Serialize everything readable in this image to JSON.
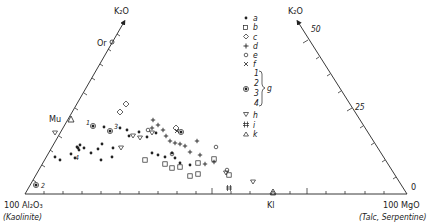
{
  "chart_data": {
    "type": "scatter",
    "subtype": "ternary-projection",
    "title": "",
    "vertices": {
      "left": {
        "label": "100 Al₂O₃",
        "sublabel": "(Kaolinite)"
      },
      "right": {
        "label": "100 MgO",
        "sublabel": "(Talc, Serpentine)"
      },
      "top_left_axis": {
        "label": "K₂O"
      },
      "top_right_axis": {
        "label": "K₂O"
      }
    },
    "left_axis_markers": [
      {
        "label": "Or",
        "meaning": "orthoclase"
      },
      {
        "label": "Mu",
        "meaning": "muscovite"
      }
    ],
    "bottom_axis_markers": [
      {
        "label": "Kl"
      }
    ],
    "right_axis_ticks": [
      "50",
      "25",
      "0"
    ],
    "legend": [
      {
        "symbol": "filled-dot",
        "label": "a"
      },
      {
        "symbol": "open-square",
        "label": "b"
      },
      {
        "symbol": "open-diamond",
        "label": "c"
      },
      {
        "symbol": "plus",
        "label": "d"
      },
      {
        "symbol": "open-circle",
        "label": "e"
      },
      {
        "symbol": "cross",
        "label": "f"
      },
      {
        "symbol": "circled-dot",
        "label": "g",
        "members": [
          "1",
          "2",
          "3",
          "4"
        ]
      },
      {
        "symbol": "open-down-triangle",
        "label": "h"
      },
      {
        "symbol": "hash",
        "label": "i"
      },
      {
        "symbol": "open-up-triangle",
        "label": "k"
      }
    ],
    "series": [
      {
        "name": "a",
        "symbol": "filled-dot",
        "points_px": [
          [
            55,
            157
          ],
          [
            60,
            160
          ],
          [
            71,
            154
          ],
          [
            77,
            147
          ],
          [
            78,
            148
          ],
          [
            79,
            150
          ],
          [
            80,
            145
          ],
          [
            75,
            158
          ],
          [
            84,
            148
          ],
          [
            91,
            153
          ],
          [
            98,
            149
          ],
          [
            102,
            144
          ],
          [
            101,
            160
          ],
          [
            104,
            127
          ],
          [
            113,
            148
          ],
          [
            112,
            157
          ],
          [
            127,
            130
          ],
          [
            129,
            136
          ],
          [
            120,
            128
          ],
          [
            139,
            132
          ],
          [
            147,
            137
          ],
          [
            152,
            153
          ],
          [
            158,
            155
          ],
          [
            165,
            157
          ],
          [
            172,
            153
          ],
          [
            175,
            158
          ],
          [
            180,
            163
          ],
          [
            190,
            165
          ],
          [
            156,
            133
          ]
        ]
      },
      {
        "name": "b",
        "symbol": "open-square",
        "points_px": [
          [
            145,
            160
          ],
          [
            165,
            164
          ],
          [
            172,
            168
          ],
          [
            180,
            167
          ],
          [
            190,
            176
          ],
          [
            198,
            163
          ],
          [
            198,
            174
          ],
          [
            214,
            159
          ],
          [
            229,
            175
          ]
        ]
      },
      {
        "name": "c",
        "symbol": "open-diamond",
        "points_px": [
          [
            120,
            112
          ],
          [
            126,
            104
          ],
          [
            176,
            128
          ]
        ]
      },
      {
        "name": "d",
        "symbol": "plus",
        "points_px": [
          [
            153,
            120
          ],
          [
            152,
            128
          ],
          [
            158,
            125
          ],
          [
            163,
            130
          ],
          [
            166,
            136
          ],
          [
            170,
            141
          ],
          [
            175,
            143
          ],
          [
            180,
            144
          ],
          [
            185,
            146
          ],
          [
            190,
            152
          ],
          [
            197,
            141
          ],
          [
            200,
            155
          ],
          [
            205,
            164
          ],
          [
            214,
            162
          ]
        ]
      },
      {
        "name": "e",
        "symbol": "open-circle",
        "points_px": [
          [
            148,
            130
          ],
          [
            172,
            154
          ],
          [
            216,
            147
          ],
          [
            227,
            170
          ]
        ]
      },
      {
        "name": "f",
        "symbol": "cross",
        "points_px": [
          [
            177,
            131
          ]
        ]
      },
      {
        "name": "g",
        "symbol": "circled-dot",
        "points_px": [
          [
            93,
            126
          ],
          [
            36,
            185
          ],
          [
            110,
            131
          ],
          [
            181,
            132
          ]
        ],
        "labels": [
          "1",
          "2",
          "3",
          "4"
        ]
      },
      {
        "name": "h",
        "symbol": "open-down-triangle",
        "points_px": [
          [
            55,
            133
          ],
          [
            140,
            138
          ],
          [
            152,
            133
          ],
          [
            121,
            148
          ],
          [
            133,
            136
          ],
          [
            226,
            173
          ],
          [
            253,
            182
          ]
        ]
      },
      {
        "name": "i",
        "symbol": "hash",
        "points_px": [
          [
            229,
            188
          ]
        ]
      },
      {
        "name": "k",
        "symbol": "open-up-triangle",
        "points_px": [
          [
            273,
            193
          ]
        ]
      }
    ],
    "grid": false,
    "legend_position": "upper-center"
  }
}
